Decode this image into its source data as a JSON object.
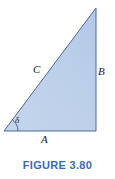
{
  "figure": {
    "caption": "FIGURE 3.80",
    "caption_color": "#3b6bb5",
    "background_color": "#ffffff"
  },
  "diagram": {
    "type": "right-triangle",
    "fill_color": "#bdd0ea",
    "stroke_color": "#4a6a9e",
    "stroke_width": 1,
    "vertices": {
      "bottom_left": [
        4,
        131
      ],
      "bottom_right": [
        96,
        131
      ],
      "top_right": [
        96,
        8
      ]
    },
    "labels": {
      "hypotenuse": "C",
      "vertical_side": "B",
      "base_side": "A",
      "angle": "δ"
    },
    "angle_arc": {
      "at_vertex": "bottom_left",
      "radius": 14
    }
  }
}
